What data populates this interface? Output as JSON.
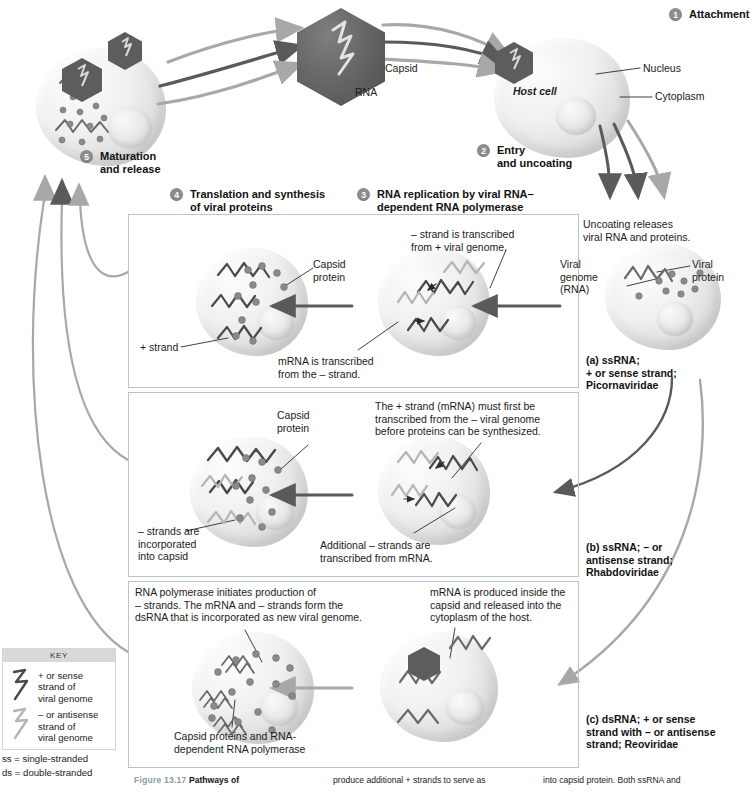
{
  "figure": {
    "number": "Figure 13.17",
    "title": "Pathways of",
    "col2": "produce additional + strands to serve as",
    "col3": "into capsid protein. Both ssRNA and"
  },
  "steps": {
    "s1": {
      "num": "1",
      "label": "Attachment"
    },
    "s2": {
      "num": "2",
      "label": "Entry\nand uncoating"
    },
    "s3": {
      "num": "3",
      "label": "RNA replication by viral RNA–\ndependent RNA polymerase"
    },
    "s4": {
      "num": "4",
      "label": "Translation and synthesis\nof viral proteins"
    },
    "s5": {
      "num": "5",
      "label": "Maturation\nand release"
    }
  },
  "virion": {
    "capsid_label": "Capsid",
    "rna_label": "RNA"
  },
  "hostcell": {
    "name": "Host cell",
    "nucleus": "Nucleus",
    "cytoplasm": "Cytoplasm"
  },
  "uncoating": {
    "note": "Uncoating releases\nviral RNA and proteins.",
    "viral_genome": "Viral\ngenome\n(RNA)",
    "viral_protein": "Viral\nprotein"
  },
  "panels": [
    {
      "id": "a",
      "group_label": "(a) ssRNA;\n+ or sense strand;\nPicornaviridae",
      "notes": {
        "top_right": "– strand is transcribed\nfrom + viral genome.",
        "bottom_center": "mRNA is transcribed\nfrom the – strand.",
        "capsid_protein": "Capsid\nprotein",
        "plus_strand": "+ strand"
      }
    },
    {
      "id": "b",
      "group_label": "(b) ssRNA; – or\nantisense strand;\nRhabdoviridae",
      "notes": {
        "top_right": "The + strand (mRNA) must first be\ntranscribed from the – viral genome\nbefore proteins can be synthesized.",
        "bottom_center": "Additional – strands are\ntranscribed from mRNA.",
        "capsid_protein": "Capsid\nprotein",
        "minus_strands": "– strands are\nincorporated\ninto capsid"
      }
    },
    {
      "id": "c",
      "group_label": "(c) dsRNA; + or sense\nstrand with – or antisense\nstrand; Reoviridae",
      "notes": {
        "top_left": "RNA polymerase initiates production of\n– strands. The mRNA and – strands form the\ndsRNA that is incorporated as new viral genome.",
        "top_right": "mRNA is produced inside the\ncapsid and released into the\ncytoplasm of the host.",
        "bottom_center": "Capsid proteins and RNA-\ndependent RNA polymerase"
      }
    }
  ],
  "key": {
    "title": "KEY",
    "entry_plus": "+ or sense\nstrand of\nviral genome",
    "entry_minus": "– or antisense\nstrand of\nviral genome",
    "ss": "ss = single-stranded",
    "ds": "ds = double-stranded"
  },
  "colors": {
    "capsid_dark": "#5d5d5d",
    "arrow_dark": "#5a5a5a",
    "arrow_light": "#a8a8a8",
    "badge": "#8d8d8d",
    "panel_border": "#b9c4cf",
    "key_header": "#d9d9d9",
    "caption_figlabel": "#8f9aa3",
    "plus_strand_stroke": "#4a4a4a",
    "minus_strand_stroke": "#b5b5b5"
  }
}
